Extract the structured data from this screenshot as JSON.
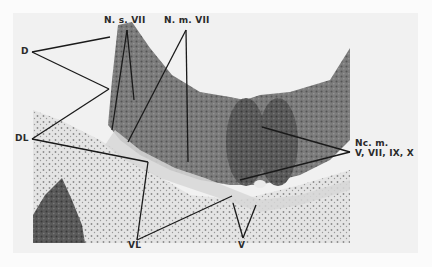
{
  "figure": {
    "type": "histological section micrograph",
    "labels": {
      "d": "D",
      "dl": "DL",
      "ns7": "N. s. VII",
      "nm7": "N. m. VII",
      "ncm_line1": "Nc. m.",
      "ncm_line2": "V, VII, IX, X",
      "vl": "VL",
      "v": "V"
    }
  }
}
